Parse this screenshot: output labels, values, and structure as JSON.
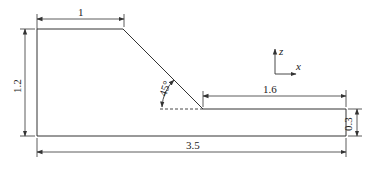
{
  "diagram": {
    "type": "cross-section geometry with dimensions",
    "colors": {
      "stroke": "#333333",
      "text": "#222222",
      "background": "#ffffff"
    },
    "dimensions": {
      "top_width": "1",
      "total_height": "1.2",
      "slope_angle": "45°",
      "step_length": "1.6",
      "step_height": "0.3",
      "total_length": "3.5"
    },
    "axes": {
      "vertical": "z",
      "horizontal": "x"
    }
  }
}
